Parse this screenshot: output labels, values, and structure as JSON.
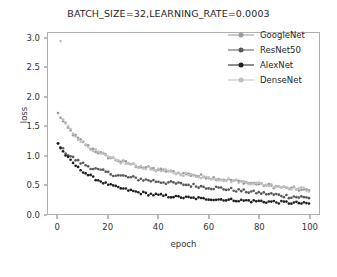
{
  "chart_data": {
    "type": "scatter",
    "title": "BATCH_SIZE=32,LEARNING_RATE=0.0003",
    "xlabel": "epoch",
    "ylabel": "loss",
    "xlim": [
      -4,
      104
    ],
    "ylim": [
      0.0,
      3.1
    ],
    "xticks": [
      0,
      20,
      40,
      60,
      80,
      100
    ],
    "xtick_labels": [
      "0",
      "20",
      "40",
      "60",
      "80",
      "100"
    ],
    "yticks": [
      0.0,
      0.5,
      1.0,
      1.5,
      2.0,
      2.5,
      3.0
    ],
    "ytick_labels": [
      "0.0",
      "0.5",
      "1.0",
      "1.5",
      "2.0",
      "2.5",
      "3.0"
    ],
    "grid": false,
    "legend_position": "upper right",
    "series": [
      {
        "name": "GoogleNet",
        "color": "#9a9a9a",
        "marker": "dot",
        "x": [
          0,
          1,
          2,
          3,
          4,
          5,
          6,
          7,
          8,
          9,
          10,
          11,
          12,
          13,
          14,
          15,
          16,
          17,
          18,
          19,
          20,
          21,
          22,
          23,
          24,
          25,
          26,
          27,
          28,
          29,
          30,
          31,
          32,
          33,
          34,
          35,
          36,
          37,
          38,
          39,
          40,
          41,
          42,
          43,
          44,
          45,
          46,
          47,
          48,
          49,
          50,
          51,
          52,
          53,
          54,
          55,
          56,
          57,
          58,
          59,
          60,
          61,
          62,
          63,
          64,
          65,
          66,
          67,
          68,
          69,
          70,
          71,
          72,
          73,
          74,
          75,
          76,
          77,
          78,
          79,
          80,
          81,
          82,
          83,
          84,
          85,
          86,
          87,
          88,
          89,
          90,
          91,
          92,
          93,
          94,
          95,
          96,
          97,
          98,
          99,
          100
        ],
        "y": [
          1.72,
          1.66,
          1.58,
          1.53,
          1.47,
          1.42,
          1.37,
          1.33,
          1.29,
          1.26,
          1.22,
          1.19,
          1.16,
          1.13,
          1.11,
          1.08,
          1.06,
          1.04,
          1.02,
          1.0,
          0.98,
          0.96,
          0.95,
          0.93,
          0.92,
          0.9,
          0.89,
          0.88,
          0.87,
          0.86,
          0.84,
          0.83,
          0.82,
          0.81,
          0.8,
          0.8,
          0.79,
          0.78,
          0.77,
          0.76,
          0.76,
          0.75,
          0.74,
          0.74,
          0.73,
          0.72,
          0.72,
          0.71,
          0.7,
          0.7,
          0.69,
          0.69,
          0.68,
          0.67,
          0.67,
          0.66,
          0.65,
          0.65,
          0.64,
          0.64,
          0.63,
          0.62,
          0.62,
          0.61,
          0.61,
          0.6,
          0.59,
          0.59,
          0.58,
          0.58,
          0.57,
          0.56,
          0.56,
          0.55,
          0.55,
          0.54,
          0.53,
          0.53,
          0.52,
          0.52,
          0.51,
          0.5,
          0.5,
          0.49,
          0.49,
          0.48,
          0.47,
          0.47,
          0.46,
          0.46,
          0.45,
          0.44,
          0.44,
          0.43,
          0.43,
          0.42,
          0.42,
          0.41,
          0.41,
          0.4,
          0.4
        ]
      },
      {
        "name": "ResNet50",
        "color": "#5a5a5a",
        "marker": "dot",
        "x": [
          0,
          1,
          2,
          3,
          4,
          5,
          6,
          7,
          8,
          9,
          10,
          11,
          12,
          13,
          14,
          15,
          16,
          17,
          18,
          19,
          20,
          21,
          22,
          23,
          24,
          25,
          26,
          27,
          28,
          29,
          30,
          31,
          32,
          33,
          34,
          35,
          36,
          37,
          38,
          39,
          40,
          41,
          42,
          43,
          44,
          45,
          46,
          47,
          48,
          49,
          50,
          51,
          52,
          53,
          54,
          55,
          56,
          57,
          58,
          59,
          60,
          61,
          62,
          63,
          64,
          65,
          66,
          67,
          68,
          69,
          70,
          71,
          72,
          73,
          74,
          75,
          76,
          77,
          78,
          79,
          80,
          81,
          82,
          83,
          84,
          85,
          86,
          87,
          88,
          89,
          90,
          91,
          92,
          93,
          94,
          95,
          96,
          97,
          98,
          99,
          100
        ],
        "y": [
          1.2,
          1.15,
          1.1,
          1.06,
          1.02,
          0.99,
          0.96,
          0.93,
          0.9,
          0.88,
          0.86,
          0.84,
          0.82,
          0.8,
          0.78,
          0.77,
          0.75,
          0.74,
          0.73,
          0.72,
          0.7,
          0.69,
          0.68,
          0.67,
          0.66,
          0.65,
          0.65,
          0.64,
          0.63,
          0.62,
          0.62,
          0.61,
          0.6,
          0.6,
          0.59,
          0.58,
          0.58,
          0.57,
          0.57,
          0.56,
          0.56,
          0.55,
          0.55,
          0.54,
          0.54,
          0.53,
          0.53,
          0.52,
          0.52,
          0.51,
          0.51,
          0.5,
          0.5,
          0.49,
          0.49,
          0.48,
          0.48,
          0.47,
          0.47,
          0.46,
          0.46,
          0.45,
          0.45,
          0.45,
          0.44,
          0.44,
          0.43,
          0.43,
          0.42,
          0.42,
          0.41,
          0.41,
          0.4,
          0.4,
          0.39,
          0.39,
          0.38,
          0.38,
          0.37,
          0.37,
          0.36,
          0.36,
          0.35,
          0.35,
          0.34,
          0.34,
          0.33,
          0.33,
          0.32,
          0.32,
          0.31,
          0.31,
          0.3,
          0.3,
          0.3,
          0.29,
          0.29,
          0.29,
          0.28,
          0.28,
          0.28
        ]
      },
      {
        "name": "AlexNet",
        "color": "#1f1f1f",
        "marker": "dot",
        "x": [
          0,
          1,
          2,
          3,
          4,
          5,
          6,
          7,
          8,
          9,
          10,
          11,
          12,
          13,
          14,
          15,
          16,
          17,
          18,
          19,
          20,
          21,
          22,
          23,
          24,
          25,
          26,
          27,
          28,
          29,
          30,
          31,
          32,
          33,
          34,
          35,
          36,
          37,
          38,
          39,
          40,
          41,
          42,
          43,
          44,
          45,
          46,
          47,
          48,
          49,
          50,
          51,
          52,
          53,
          54,
          55,
          56,
          57,
          58,
          59,
          60,
          61,
          62,
          63,
          64,
          65,
          66,
          67,
          68,
          69,
          70,
          71,
          72,
          73,
          74,
          75,
          76,
          77,
          78,
          79,
          80,
          81,
          82,
          83,
          84,
          85,
          86,
          87,
          88,
          89,
          90,
          91,
          92,
          93,
          94,
          95,
          96,
          97,
          98,
          99,
          100
        ],
        "y": [
          1.21,
          1.14,
          1.07,
          1.01,
          0.96,
          0.91,
          0.87,
          0.83,
          0.79,
          0.76,
          0.73,
          0.7,
          0.67,
          0.65,
          0.62,
          0.6,
          0.58,
          0.56,
          0.54,
          0.52,
          0.51,
          0.49,
          0.48,
          0.46,
          0.45,
          0.44,
          0.43,
          0.42,
          0.41,
          0.4,
          0.39,
          0.38,
          0.37,
          0.36,
          0.36,
          0.35,
          0.34,
          0.34,
          0.33,
          0.33,
          0.32,
          0.32,
          0.31,
          0.31,
          0.3,
          0.3,
          0.3,
          0.29,
          0.29,
          0.29,
          0.28,
          0.28,
          0.28,
          0.27,
          0.27,
          0.27,
          0.27,
          0.26,
          0.26,
          0.26,
          0.26,
          0.26,
          0.25,
          0.25,
          0.25,
          0.25,
          0.25,
          0.24,
          0.24,
          0.24,
          0.24,
          0.24,
          0.23,
          0.23,
          0.23,
          0.23,
          0.23,
          0.22,
          0.22,
          0.22,
          0.22,
          0.22,
          0.21,
          0.21,
          0.21,
          0.21,
          0.21,
          0.2,
          0.2,
          0.2,
          0.2,
          0.2,
          0.19,
          0.19,
          0.19,
          0.19,
          0.19,
          0.18,
          0.18,
          0.18,
          0.18
        ]
      },
      {
        "name": "DenseNet",
        "color": "#c0c0c0",
        "marker": "dot",
        "x": [
          1,
          2,
          3,
          4,
          5,
          6,
          7,
          8,
          9,
          10,
          11,
          12,
          13,
          14,
          15,
          16,
          17,
          18,
          19,
          20,
          21,
          22,
          23,
          24,
          25,
          26,
          27,
          28,
          29,
          30,
          31,
          32,
          33,
          34,
          35,
          36,
          37,
          38,
          39,
          40,
          41,
          42,
          43,
          44,
          45,
          46,
          47,
          48,
          49,
          50,
          51,
          52,
          53,
          54,
          55,
          56,
          57,
          58,
          59,
          60,
          61,
          62,
          63,
          64,
          65,
          66,
          67,
          68,
          69,
          70,
          71,
          72,
          73,
          74,
          75,
          76,
          77,
          78,
          79,
          80,
          81,
          82,
          83,
          84,
          85,
          86,
          87,
          88,
          89,
          90,
          91,
          92,
          93,
          94,
          95,
          96,
          97,
          98,
          99,
          100
        ],
        "y": [
          2.95,
          1.62,
          1.55,
          1.49,
          1.44,
          1.39,
          1.34,
          1.3,
          1.26,
          1.22,
          1.19,
          1.16,
          1.13,
          1.1,
          1.08,
          1.05,
          1.03,
          1.01,
          0.99,
          0.97,
          0.95,
          0.94,
          0.92,
          0.91,
          0.89,
          0.88,
          0.87,
          0.86,
          0.85,
          0.84,
          0.83,
          0.82,
          0.81,
          0.8,
          0.79,
          0.78,
          0.77,
          0.76,
          0.76,
          0.75,
          0.74,
          0.73,
          0.73,
          0.72,
          0.71,
          0.71,
          0.7,
          0.69,
          0.69,
          0.68,
          0.68,
          0.67,
          0.66,
          0.66,
          0.65,
          0.65,
          0.64,
          0.63,
          0.63,
          0.62,
          0.62,
          0.61,
          0.61,
          0.6,
          0.6,
          0.59,
          0.58,
          0.58,
          0.57,
          0.57,
          0.56,
          0.56,
          0.55,
          0.55,
          0.54,
          0.54,
          0.53,
          0.53,
          0.52,
          0.52,
          0.51,
          0.51,
          0.5,
          0.5,
          0.49,
          0.49,
          0.48,
          0.48,
          0.47,
          0.47,
          0.46,
          0.46,
          0.45,
          0.45,
          0.44,
          0.44,
          0.43,
          0.43,
          0.42,
          0.41
        ]
      }
    ]
  },
  "legend": {
    "items": [
      {
        "label": "GoogleNet"
      },
      {
        "label": "ResNet50"
      },
      {
        "label": "AlexNet"
      },
      {
        "label": "DenseNet"
      }
    ]
  }
}
